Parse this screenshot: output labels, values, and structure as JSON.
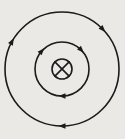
{
  "figure": {
    "width": 125,
    "height": 139,
    "background": "#eae9e6",
    "stroke_color": "#1b1b1b",
    "stroke_width": 1.6,
    "center": {
      "x": 62,
      "y": 69
    },
    "direction": "clockwise",
    "field_lines": [
      {
        "name": "outer-field-line",
        "radius": 57,
        "arrow_angles_deg": [
          -90,
          44,
          151
        ]
      },
      {
        "name": "inner-field-line",
        "radius": 27,
        "arrow_angles_deg": [
          -90,
          44,
          138
        ]
      }
    ],
    "arrow": {
      "length": 7,
      "half_width": 2.7
    },
    "center_symbol": {
      "name": "current-into-page-symbol",
      "type": "circled-x",
      "radius": 10,
      "x_extent": 7.1
    }
  }
}
